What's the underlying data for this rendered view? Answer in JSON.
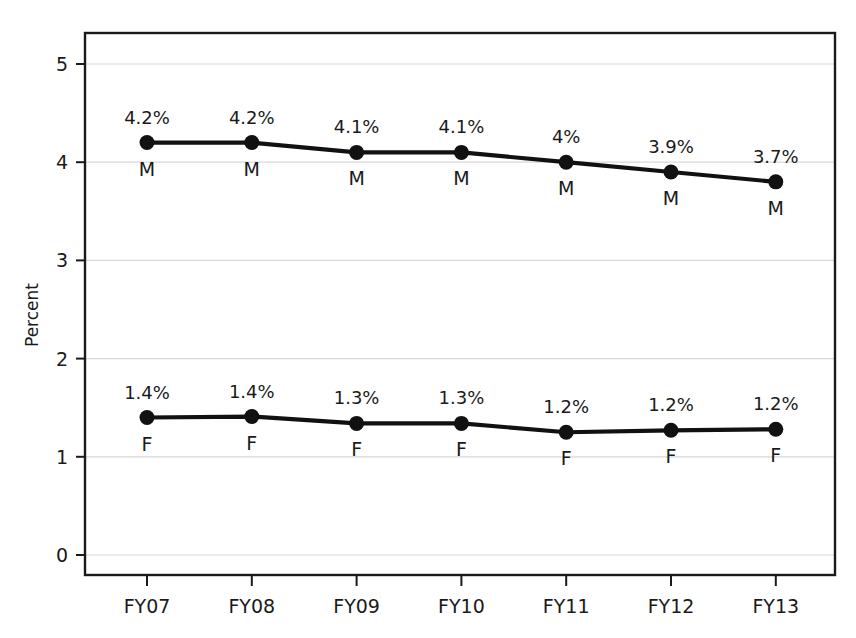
{
  "chart_data": {
    "type": "line",
    "title": "",
    "xlabel": "",
    "ylabel": "Percent",
    "categories": [
      "FY07",
      "FY08",
      "FY09",
      "FY10",
      "FY11",
      "FY12",
      "FY13"
    ],
    "ylim": [
      0,
      5
    ],
    "y_ticks": [
      "0",
      "1",
      "2",
      "3",
      "4",
      "5"
    ],
    "grid": true,
    "legend_position": "inline-point-labels",
    "series": [
      {
        "name": "M",
        "point_label": "M",
        "values": [
          4.2,
          4.2,
          4.1,
          4.1,
          4.0,
          3.9,
          3.8
        ],
        "value_labels": [
          "4.2%",
          "4.2%",
          "4.1%",
          "4.1%",
          "4%",
          "3.9%",
          "3.7%"
        ],
        "color": "#111111"
      },
      {
        "name": "F",
        "point_label": "F",
        "values": [
          1.4,
          1.41,
          1.34,
          1.34,
          1.25,
          1.27,
          1.28
        ],
        "value_labels": [
          "1.4%",
          "1.4%",
          "1.3%",
          "1.3%",
          "1.2%",
          "1.2%",
          "1.2%"
        ],
        "color": "#111111"
      }
    ]
  },
  "style": {
    "line_color": "#111111",
    "marker_color": "#111111",
    "frame_color": "#1a1a1a",
    "grid_color": "#d8d8d8",
    "background": "#ffffff"
  }
}
